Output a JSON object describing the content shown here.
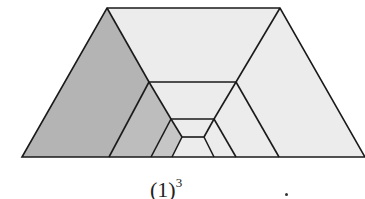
{
  "figure": {
    "caption_base": "(1)",
    "caption_exponent": "3",
    "colors": {
      "shaded": "#b4b4b4",
      "light": "#ececec",
      "stroke": "#1a1a1a"
    }
  }
}
